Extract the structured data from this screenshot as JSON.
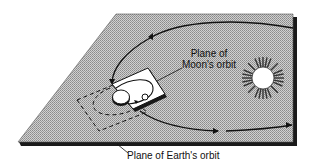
{
  "diagram": {
    "labels": {
      "moon_plane_line1": "Plane of",
      "moon_plane_line2": "Moon's orbit",
      "earth_plane": "Plane of Earth's orbit"
    },
    "colors": {
      "plane_fill": "#b8b8b8",
      "plane_shadow": "#1a1a1a",
      "moon_plane_fill": "#ffffff",
      "line": "#111111",
      "sun_fill": "#ffffff",
      "sun_rays": "#333333"
    },
    "elements": [
      "Plane of Earth's orbit",
      "Plane of Moon's orbit",
      "Sun",
      "Earth",
      "Moon",
      "Earth's orbit path",
      "Moon's orbit path"
    ]
  }
}
